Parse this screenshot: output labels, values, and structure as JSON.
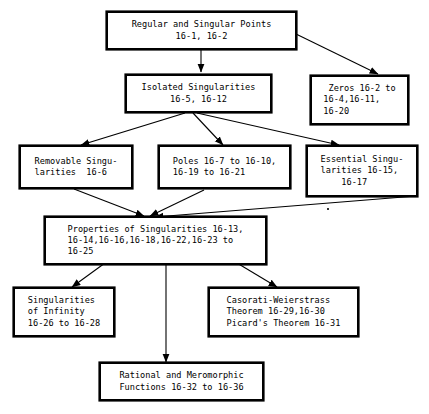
{
  "diagram": {
    "type": "flowchart",
    "background_color": "#ffffff",
    "line_color": "#000000",
    "box_border_color": "#000000",
    "nodes": [
      {
        "id": "regular-singular-points",
        "label": "Regular and Singular Points\n16-1, 16-2",
        "align": "center"
      },
      {
        "id": "isolated-singularities",
        "label": "Isolated Singularities\n16-5, 16-12",
        "align": "center"
      },
      {
        "id": "zeros",
        "label": " Zeros 16-2 to\n16-4,16-11,\n16-20",
        "align": "left"
      },
      {
        "id": "removable-singularities",
        "label": "Removable Singu-\nlarities  16-6",
        "align": "left"
      },
      {
        "id": "poles",
        "label": "Poles 16-7 to 16-10,\n16-19 to 16-21",
        "align": "left"
      },
      {
        "id": "essential-singularities",
        "label": "Essential Singu-\nlarities 16-15,\n    16-17",
        "align": "left"
      },
      {
        "id": "properties-of-singularities",
        "label": "Properties of Singularities 16-13,\n16-14,16-16,16-18,16-22,16-23 to\n16-25",
        "align": "left"
      },
      {
        "id": "singularities-of-infinity",
        "label": "Singularities\nof Infinity\n16-26 to 16-28",
        "align": "left"
      },
      {
        "id": "casorati-weierstrass",
        "label": "Casorati-Weierstrass\nTheorem 16-29,16-30\nPicard's Theorem 16-31",
        "align": "left"
      },
      {
        "id": "rational-meromorphic",
        "label": "Rational and Meromorphic\nFunctions 16-32 to 16-36",
        "align": "left"
      }
    ],
    "edges": [
      {
        "from": "regular-singular-points",
        "to": "isolated-singularities"
      },
      {
        "from": "regular-singular-points",
        "to": "zeros"
      },
      {
        "from": "isolated-singularities",
        "to": "removable-singularities"
      },
      {
        "from": "isolated-singularities",
        "to": "poles"
      },
      {
        "from": "isolated-singularities",
        "to": "essential-singularities"
      },
      {
        "from": "removable-singularities",
        "to": "properties-of-singularities"
      },
      {
        "from": "poles",
        "to": "properties-of-singularities"
      },
      {
        "from": "essential-singularities",
        "to": "properties-of-singularities"
      },
      {
        "from": "properties-of-singularities",
        "to": "singularities-of-infinity"
      },
      {
        "from": "properties-of-singularities",
        "to": "casorati-weierstrass"
      },
      {
        "from": "properties-of-singularities",
        "to": "rational-meromorphic"
      }
    ]
  }
}
